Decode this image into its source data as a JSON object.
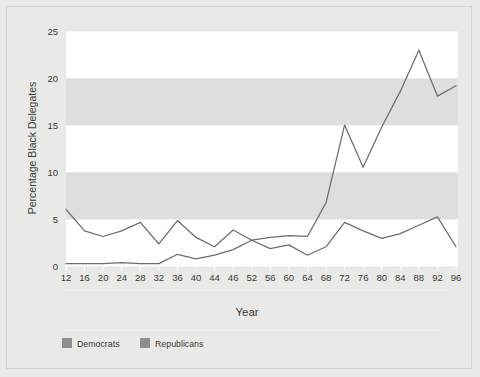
{
  "chart_data": {
    "type": "line",
    "title": "",
    "xlabel": "Year",
    "ylabel": "Percentage Black Delegates",
    "categories": [
      "12",
      "16",
      "20",
      "24",
      "28",
      "32",
      "36",
      "40",
      "44",
      "46",
      "52",
      "56",
      "60",
      "64",
      "68",
      "72",
      "76",
      "80",
      "84",
      "88",
      "92",
      "96"
    ],
    "xtick_labels": [
      "12",
      "16",
      "20",
      "24",
      "28",
      "32",
      "36",
      "40",
      "44",
      "46",
      "52",
      "56",
      "60",
      "64",
      "68",
      "72",
      "76",
      "80",
      "84",
      "88",
      "92",
      "96"
    ],
    "ytick_labels": [
      "0",
      "5",
      "10",
      "15",
      "20",
      "25"
    ],
    "ytick_values": [
      0,
      5,
      10,
      15,
      20,
      25
    ],
    "ylim": [
      0,
      25
    ],
    "grid": "alternating-horizontal-bands",
    "legend_position": "bottom-left",
    "series": [
      {
        "name": "Democrats",
        "color": "#6c6c6c",
        "values": [
          0.2,
          0.2,
          0.2,
          0.3,
          0.2,
          0.2,
          1.2,
          0.7,
          1.1,
          1.7,
          2.7,
          1.8,
          2.2,
          1.1,
          2.0,
          4.6,
          3.7,
          2.9,
          3.4,
          4.3,
          5.2,
          2.0
        ]
      },
      {
        "name": "Republicans",
        "color": "#6c6c6c",
        "values": [
          6.0,
          3.7,
          3.1,
          3.7,
          4.6,
          2.3,
          4.8,
          3.0,
          2.0,
          3.8,
          2.7,
          3.0,
          3.2,
          3.1,
          6.7,
          15.0,
          10.5,
          14.8,
          18.6,
          23.0,
          18.1,
          19.2
        ]
      }
    ],
    "spike_series_note": "Democrats line is the low wavy series; Republicans line is the one rising sharply after 1964"
  },
  "axis": {
    "y_title": "Percentage Black Delegates",
    "x_title": "Year"
  },
  "legend": {
    "items": [
      {
        "label": "Democrats",
        "color": "#8e8e8e"
      },
      {
        "label": "Republicans",
        "color": "#8e8e8e"
      }
    ]
  },
  "colors": {
    "page_background": "#e9e9e7",
    "band_light": "#ffffff",
    "band_dark": "#dedede",
    "line": "#6c6c6c",
    "text": "#3b3b3b"
  }
}
